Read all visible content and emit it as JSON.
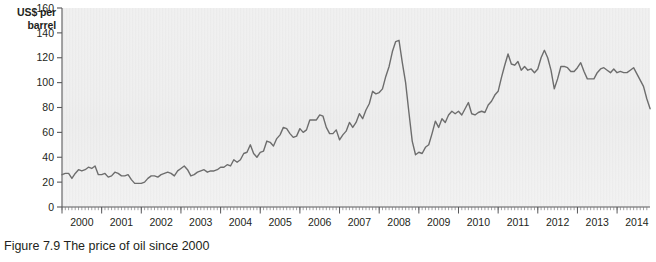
{
  "figure": {
    "caption": "Figure 7.9 The price of oil since 2000",
    "y_axis_title_line1": "US$ per",
    "y_axis_title_line2": "barrel"
  },
  "chart_data": {
    "type": "line",
    "title": "",
    "subtitle": "",
    "xlabel": "",
    "ylabel": "US$ per barrel",
    "ylim": [
      0,
      160
    ],
    "yticks": [
      0,
      20,
      40,
      60,
      80,
      100,
      120,
      140,
      160
    ],
    "xlim": [
      2000.0,
      2014.83
    ],
    "xticks": [
      2000,
      2001,
      2002,
      2003,
      2004,
      2005,
      2006,
      2007,
      2008,
      2009,
      2010,
      2011,
      2012,
      2013,
      2014
    ],
    "xtick_labels": [
      "2000",
      "2001",
      "2002",
      "2003",
      "2004",
      "2005",
      "2006",
      "2007",
      "2008",
      "2009",
      "2010",
      "2011",
      "2012",
      "2013",
      "2014"
    ],
    "minor_xticks_per_year": 12,
    "grid": false,
    "legend": null,
    "legend_position": "none",
    "line_color": "#6d6d6d",
    "line_width": 1.4,
    "plot_background": "#f2f2f2",
    "series": [
      {
        "name": "Price of oil",
        "units": "US$ per barrel",
        "x_start": 2000.0,
        "x_step": 0.08333,
        "values": [
          26,
          27,
          27,
          23,
          27,
          30,
          29,
          30,
          32,
          31,
          33,
          26,
          26,
          27,
          24,
          25,
          28,
          27,
          25,
          25,
          26,
          22,
          19,
          19,
          19,
          20,
          23,
          25,
          25,
          24,
          26,
          27,
          28,
          27,
          25,
          29,
          31,
          33,
          30,
          25,
          26,
          28,
          29,
          30,
          28,
          29,
          29,
          30,
          32,
          32,
          34,
          33,
          38,
          36,
          38,
          43,
          44,
          50,
          43,
          40,
          44,
          45,
          53,
          52,
          49,
          55,
          58,
          64,
          63,
          59,
          56,
          57,
          63,
          60,
          62,
          70,
          70,
          70,
          74,
          73,
          64,
          59,
          59,
          62,
          54,
          58,
          61,
          68,
          64,
          68,
          75,
          71,
          78,
          83,
          93,
          91,
          92,
          95,
          105,
          113,
          125,
          133,
          134,
          116,
          100,
          76,
          53,
          42,
          44,
          43,
          48,
          50,
          59,
          69,
          64,
          71,
          68,
          74,
          77,
          75,
          77,
          74,
          79,
          84,
          75,
          74,
          76,
          77,
          76,
          82,
          85,
          90,
          93,
          104,
          114,
          123,
          115,
          114,
          117,
          110,
          113,
          110,
          111,
          108,
          111,
          120,
          126,
          120,
          110,
          95,
          103,
          113,
          113,
          112,
          109,
          109,
          112,
          116,
          109,
          103,
          103,
          103,
          108,
          111,
          112,
          110,
          108,
          111,
          108,
          109,
          108,
          108,
          110,
          112,
          107,
          102,
          97,
          87,
          79
        ]
      }
    ],
    "annotations": []
  }
}
